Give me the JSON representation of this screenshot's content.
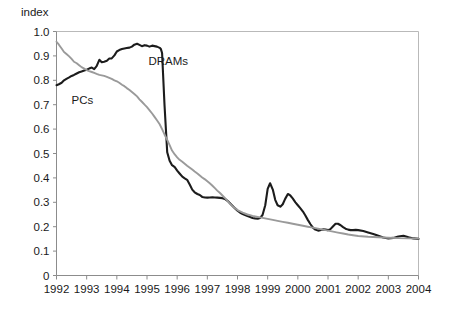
{
  "chart_data": {
    "type": "line",
    "title": "",
    "subtitle": "",
    "ylabel": "index",
    "xlabel": "",
    "ylim": [
      0,
      1.0
    ],
    "xlim": [
      1992,
      2004
    ],
    "grid": false,
    "legend_position": "inline-annotation",
    "ytick_labels": [
      "1.0",
      "0.9",
      "0.8",
      "0.7",
      "0.6",
      "0.5",
      "0.4",
      "0.3",
      "0.2",
      "0.1",
      "0"
    ],
    "ytick_values": [
      1.0,
      0.9,
      0.8,
      0.7,
      0.6,
      0.5,
      0.4,
      0.3,
      0.2,
      0.1,
      0.0
    ],
    "xtick_labels": [
      "1992",
      "1993",
      "1994",
      "1995",
      "1996",
      "1997",
      "1998",
      "1999",
      "2000",
      "2001",
      "2002",
      "2003",
      "2004"
    ],
    "xtick_values": [
      1992,
      1993,
      1994,
      1995,
      1996,
      1997,
      1998,
      1999,
      2000,
      2001,
      2002,
      2003,
      2004
    ],
    "annotations": [
      {
        "text": "DRAMs",
        "x": 1995.05,
        "y": 0.862
      },
      {
        "text": "PCs",
        "x": 1992.5,
        "y": 0.702
      }
    ],
    "series": [
      {
        "name": "DRAMs",
        "color": "#1c1c1c",
        "x": [
          1992.0,
          1992.08,
          1992.17,
          1992.25,
          1992.33,
          1992.42,
          1992.5,
          1992.58,
          1992.67,
          1992.75,
          1992.83,
          1992.92,
          1993.0,
          1993.08,
          1993.17,
          1993.25,
          1993.33,
          1993.42,
          1993.5,
          1993.58,
          1993.67,
          1993.75,
          1993.83,
          1993.92,
          1994.0,
          1994.08,
          1994.17,
          1994.25,
          1994.33,
          1994.42,
          1994.5,
          1994.58,
          1994.67,
          1994.75,
          1994.83,
          1994.92,
          1995.0,
          1995.08,
          1995.17,
          1995.25,
          1995.33,
          1995.42,
          1995.46,
          1995.5,
          1995.58,
          1995.67,
          1995.75,
          1995.83,
          1995.92,
          1996.0,
          1996.08,
          1996.17,
          1996.25,
          1996.33,
          1996.42,
          1996.5,
          1996.58,
          1996.67,
          1996.75,
          1996.83,
          1996.92,
          1997.0,
          1997.08,
          1997.17,
          1997.25,
          1997.33,
          1997.42,
          1997.5,
          1997.58,
          1997.67,
          1997.75,
          1997.83,
          1997.92,
          1998.0,
          1998.08,
          1998.17,
          1998.25,
          1998.33,
          1998.42,
          1998.5,
          1998.58,
          1998.67,
          1998.75,
          1998.83,
          1998.92,
          1999.0,
          1999.08,
          1999.17,
          1999.25,
          1999.33,
          1999.42,
          1999.5,
          1999.58,
          1999.67,
          1999.75,
          1999.83,
          1999.92,
          2000.0,
          2000.08,
          2000.17,
          2000.25,
          2000.33,
          2000.42,
          2000.5,
          2000.58,
          2000.67,
          2000.75,
          2000.83,
          2000.92,
          2001.0,
          2001.08,
          2001.17,
          2001.25,
          2001.33,
          2001.42,
          2001.5,
          2001.58,
          2001.67,
          2001.75,
          2001.83,
          2001.92,
          2002.0,
          2002.17,
          2002.33,
          2002.5,
          2002.67,
          2002.83,
          2003.0,
          2003.17,
          2003.33,
          2003.5,
          2003.67,
          2003.83,
          2004.0
        ],
        "y": [
          0.78,
          0.784,
          0.79,
          0.8,
          0.806,
          0.812,
          0.818,
          0.822,
          0.828,
          0.833,
          0.836,
          0.84,
          0.843,
          0.848,
          0.852,
          0.846,
          0.858,
          0.884,
          0.874,
          0.876,
          0.88,
          0.889,
          0.89,
          0.902,
          0.918,
          0.924,
          0.928,
          0.93,
          0.932,
          0.934,
          0.938,
          0.946,
          0.95,
          0.945,
          0.94,
          0.944,
          0.942,
          0.938,
          0.942,
          0.94,
          0.938,
          0.933,
          0.928,
          0.912,
          0.7,
          0.505,
          0.47,
          0.452,
          0.444,
          0.43,
          0.418,
          0.405,
          0.398,
          0.392,
          0.372,
          0.352,
          0.341,
          0.334,
          0.33,
          0.322,
          0.32,
          0.319,
          0.32,
          0.321,
          0.32,
          0.319,
          0.318,
          0.317,
          0.314,
          0.306,
          0.296,
          0.286,
          0.275,
          0.266,
          0.258,
          0.252,
          0.248,
          0.244,
          0.24,
          0.236,
          0.234,
          0.233,
          0.236,
          0.248,
          0.288,
          0.355,
          0.378,
          0.352,
          0.31,
          0.288,
          0.282,
          0.292,
          0.314,
          0.334,
          0.328,
          0.316,
          0.3,
          0.288,
          0.276,
          0.262,
          0.246,
          0.228,
          0.21,
          0.196,
          0.188,
          0.184,
          0.186,
          0.189,
          0.188,
          0.186,
          0.19,
          0.202,
          0.212,
          0.212,
          0.206,
          0.198,
          0.192,
          0.188,
          0.186,
          0.186,
          0.187,
          0.186,
          0.182,
          0.176,
          0.17,
          0.163,
          0.156,
          0.152,
          0.154,
          0.16,
          0.163,
          0.157,
          0.152,
          0.15
        ]
      },
      {
        "name": "PCs",
        "color": "#9a9a9a",
        "x": [
          1992.0,
          1992.08,
          1992.17,
          1992.25,
          1992.33,
          1992.42,
          1992.5,
          1992.58,
          1992.67,
          1992.75,
          1992.83,
          1992.92,
          1993.0,
          1993.08,
          1993.17,
          1993.25,
          1993.33,
          1993.42,
          1993.5,
          1993.58,
          1993.67,
          1993.75,
          1993.83,
          1993.92,
          1994.0,
          1994.08,
          1994.17,
          1994.25,
          1994.33,
          1994.42,
          1994.5,
          1994.58,
          1994.67,
          1994.75,
          1994.83,
          1994.92,
          1995.0,
          1995.08,
          1995.17,
          1995.25,
          1995.33,
          1995.42,
          1995.5,
          1995.58,
          1995.67,
          1995.75,
          1995.83,
          1995.92,
          1996.0,
          1996.08,
          1996.17,
          1996.25,
          1996.33,
          1996.42,
          1996.5,
          1996.58,
          1996.67,
          1996.75,
          1996.83,
          1996.92,
          1997.0,
          1997.08,
          1997.17,
          1997.25,
          1997.33,
          1997.42,
          1997.5,
          1997.58,
          1997.67,
          1997.75,
          1997.83,
          1997.92,
          1998.0,
          1998.17,
          1998.33,
          1998.5,
          1998.67,
          1998.83,
          1999.0,
          1999.17,
          1999.33,
          1999.5,
          1999.67,
          1999.83,
          2000.0,
          2000.17,
          2000.33,
          2000.5,
          2000.67,
          2000.83,
          2001.0,
          2001.17,
          2001.33,
          2001.5,
          2001.67,
          2001.83,
          2002.0,
          2002.33,
          2002.67,
          2003.0,
          2003.33,
          2003.67,
          2004.0
        ],
        "y": [
          0.958,
          0.946,
          0.93,
          0.916,
          0.908,
          0.898,
          0.888,
          0.876,
          0.87,
          0.862,
          0.854,
          0.848,
          0.842,
          0.838,
          0.834,
          0.83,
          0.826,
          0.822,
          0.82,
          0.818,
          0.814,
          0.81,
          0.806,
          0.8,
          0.796,
          0.79,
          0.782,
          0.776,
          0.768,
          0.76,
          0.752,
          0.744,
          0.734,
          0.722,
          0.712,
          0.7,
          0.69,
          0.678,
          0.664,
          0.65,
          0.636,
          0.62,
          0.6,
          0.578,
          0.556,
          0.534,
          0.512,
          0.496,
          0.484,
          0.474,
          0.466,
          0.458,
          0.45,
          0.442,
          0.434,
          0.426,
          0.418,
          0.41,
          0.402,
          0.394,
          0.386,
          0.378,
          0.368,
          0.358,
          0.348,
          0.338,
          0.328,
          0.318,
          0.306,
          0.294,
          0.284,
          0.276,
          0.268,
          0.258,
          0.25,
          0.244,
          0.24,
          0.236,
          0.232,
          0.228,
          0.224,
          0.22,
          0.216,
          0.212,
          0.208,
          0.204,
          0.2,
          0.196,
          0.192,
          0.188,
          0.184,
          0.18,
          0.176,
          0.172,
          0.168,
          0.165,
          0.162,
          0.159,
          0.157,
          0.155,
          0.153,
          0.152,
          0.151
        ]
      }
    ]
  }
}
